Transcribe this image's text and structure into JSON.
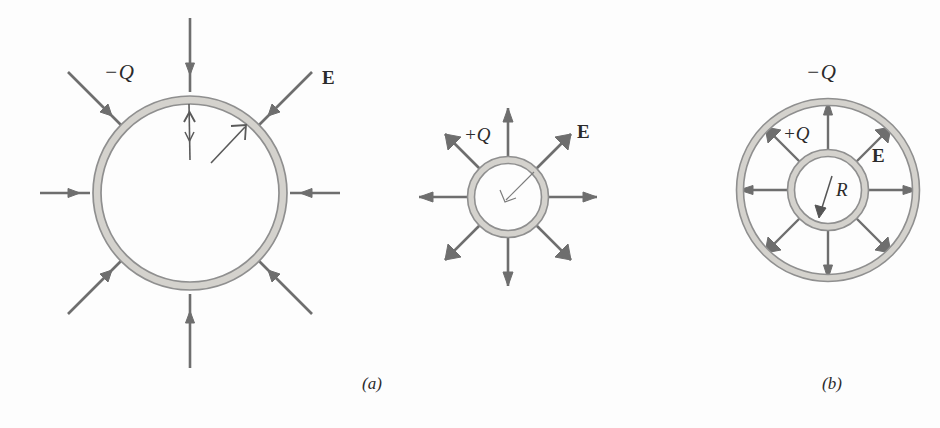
{
  "figure": {
    "domain": "physics-electrostatics-diagram",
    "background_color": "#fdfdfd",
    "shell_band_color": "#9a9a9a",
    "shell_band_fill": "#d4d2cd",
    "arrow_color": "#6e6e6e",
    "pencil_color": "#555555",
    "label_color": "#2b2b2b"
  },
  "panel_a": {
    "caption": "(a)",
    "charge_label": "−Q",
    "field_label": "E",
    "field_direction": "inward",
    "arrow_count": 8,
    "shell": {
      "cx": 190,
      "cy": 193,
      "r": 93
    },
    "annotations": [
      {
        "name": "pencil-up-arrow",
        "note": "hand-drawn vertical arrow"
      },
      {
        "name": "pencil-diagonal-arrow",
        "note": "hand-drawn diagonal arrow"
      }
    ]
  },
  "panel_b_middle": {
    "charge_label": "+Q",
    "field_label": "E",
    "radius_label": "r",
    "field_direction": "outward",
    "arrow_count": 8,
    "shell": {
      "cx": 508,
      "cy": 197,
      "r": 37
    }
  },
  "panel_b": {
    "caption": "(b)",
    "outer_charge_label": "−Q",
    "inner_charge_label": "+Q",
    "field_label": "E",
    "radius_label": "R",
    "field_direction": "outward",
    "arrow_count": 8,
    "outer_shell": {
      "cx": 828,
      "cy": 190,
      "r": 88
    },
    "inner_shell": {
      "cx": 828,
      "cy": 190,
      "r": 37
    }
  }
}
